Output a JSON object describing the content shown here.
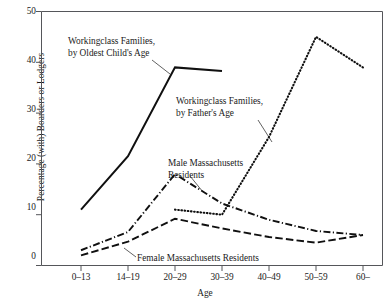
{
  "chart_data": {
    "type": "line",
    "title": "",
    "xlabel": "Age",
    "ylabel": "Percentage (with) Boarders or Lodgers",
    "categories": [
      "0–13",
      "14–19",
      "20–29",
      "30–39",
      "40–49",
      "50–59",
      "60–"
    ],
    "ylim": [
      0,
      50
    ],
    "yticks": [
      0,
      10,
      20,
      30,
      40,
      50
    ],
    "ytick_labels": [
      "0",
      "10",
      "20",
      "30",
      "40",
      "50"
    ],
    "grid": false,
    "legend": "inline annotations",
    "series": [
      {
        "name": "Workingclass Families, by Oldest Child's Age",
        "style": "solid",
        "x": [
          "0–13",
          "14–19",
          "20–29",
          "30–39"
        ],
        "values": [
          11,
          21.5,
          39,
          38.3
        ]
      },
      {
        "name": "Workingclass Families, by Father's Age",
        "style": "dotted",
        "x": [
          "20–29",
          "30–39",
          "40–49",
          "50–59",
          "60–"
        ],
        "values": [
          11,
          10,
          25.3,
          45,
          39
        ]
      },
      {
        "name": "Male Massachusetts Residents",
        "style": "dash-dot",
        "x": [
          "0–13",
          "14–19",
          "20–29",
          "30–39",
          "40–49",
          "50–59",
          "60–"
        ],
        "values": [
          3,
          6.6,
          18,
          12.2,
          9,
          6.8,
          6
        ]
      },
      {
        "name": "Female Massachusetts Residents",
        "style": "dashed",
        "x": [
          "0–13",
          "14–19",
          "20–29",
          "30–39",
          "40–49",
          "50–59",
          "60–"
        ],
        "values": [
          2,
          4.7,
          9.2,
          7.3,
          5.6,
          4.5,
          6
        ]
      }
    ],
    "annotations": [
      {
        "id": "annot-oldest-child",
        "line1": "Workingclass Families,",
        "line2": "by Oldest Child's Age"
      },
      {
        "id": "annot-fathers-age",
        "line1": "Workingclass Families,",
        "line2": "by Father's Age"
      },
      {
        "id": "annot-male-residents",
        "line1": "Male Massachusetts",
        "line2": "Residents"
      },
      {
        "id": "annot-female-residents",
        "line1": "Female Massachusetts Residents",
        "line2": ""
      }
    ]
  },
  "axis": {
    "y_title": "Percentage (with) Boarders or Lodgers",
    "x_title": "Age",
    "y_ticks": [
      "50",
      "40",
      "30",
      "20",
      "10",
      "0"
    ],
    "x_ticks": [
      "0–13",
      "14–19",
      "20–29",
      "30–39",
      "40–49",
      "50–59",
      "60–"
    ]
  },
  "colors": {
    "ink": "#101010",
    "frame": "#55565a",
    "background": "#ffffff"
  }
}
